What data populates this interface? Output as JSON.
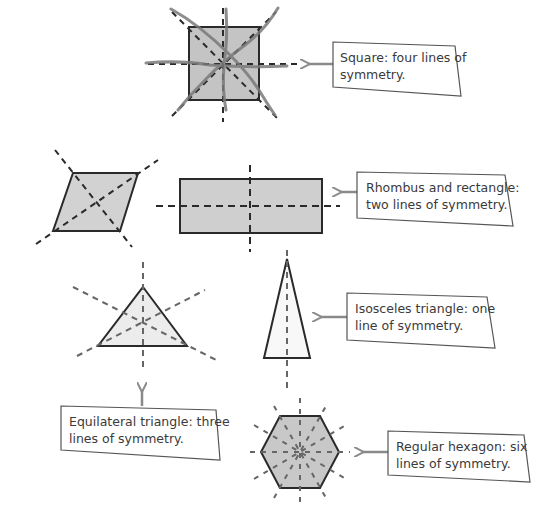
{
  "colors": {
    "shape_fill_dark": "#c8c8c8",
    "shape_fill_light": "#e6e6e6",
    "outline": "#2a2a2a",
    "dashes": "#2a2a2a",
    "dashes_light": "#666666",
    "arrow": "#8a8a8a",
    "pencil": "#777777",
    "callout_border": "#555555"
  },
  "shapes": [
    {
      "id": "square",
      "name": "Square",
      "lines_of_symmetry": 4
    },
    {
      "id": "rhombus",
      "name": "Rhombus",
      "lines_of_symmetry": 2
    },
    {
      "id": "rectangle",
      "name": "Rectangle",
      "lines_of_symmetry": 2
    },
    {
      "id": "equilateral-triangle",
      "name": "Equilateral triangle",
      "lines_of_symmetry": 3
    },
    {
      "id": "isosceles-triangle",
      "name": "Isosceles triangle",
      "lines_of_symmetry": 1
    },
    {
      "id": "regular-hexagon",
      "name": "Regular hexagon",
      "lines_of_symmetry": 6
    }
  ],
  "callouts": {
    "square": {
      "line1": "Square: four lines of",
      "line2": "symmetry."
    },
    "rhombus_rectangle": {
      "line1": "Rhombus and rectangle:",
      "line2": "two lines of symmetry."
    },
    "isosceles": {
      "line1": "Isosceles triangle: one",
      "line2": "line of symmetry."
    },
    "equilateral": {
      "line1": "Equilateral triangle: three",
      "line2": "lines of symmetry."
    },
    "hexagon": {
      "line1": "Regular hexagon: six",
      "line2": "lines of symmetry."
    }
  }
}
